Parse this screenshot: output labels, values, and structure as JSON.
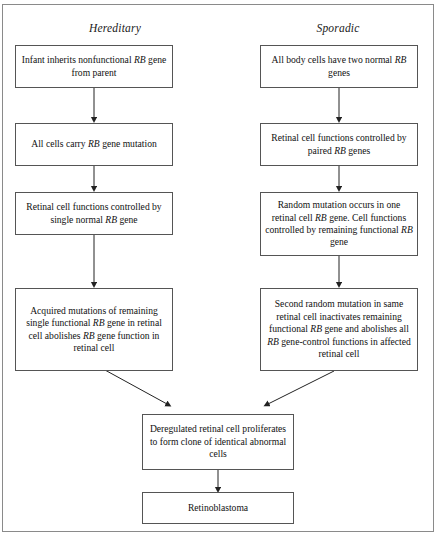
{
  "figure": {
    "type": "flowchart",
    "orientation": "top-to-bottom, two parallel columns converging",
    "frame": {
      "border_color": "#8a8a8a"
    }
  },
  "columns": [
    {
      "id": "hereditary",
      "heading": "Hereditary"
    },
    {
      "id": "sporadic",
      "heading": "Sporadic"
    }
  ],
  "nodes": {
    "h1": {
      "text": "Infant inherits nonfunctional RB gene from parent",
      "italic_tokens": [
        "RB"
      ]
    },
    "h2": {
      "text": "All cells carry RB gene mutation",
      "italic_tokens": [
        "RB"
      ]
    },
    "h3": {
      "text": "Retinal cell functions controlled by single normal RB gene",
      "italic_tokens": [
        "RB"
      ]
    },
    "h4": {
      "text": "Acquired mutations of remaining single functional RB gene in retinal cell abolishes RB gene function in retinal cell",
      "italic_tokens": [
        "RB"
      ]
    },
    "s1": {
      "text": "All body cells have two normal RB genes",
      "italic_tokens": [
        "RB"
      ]
    },
    "s2": {
      "text": "Retinal cell functions controlled by paired RB  genes",
      "italic_tokens": [
        "RB"
      ]
    },
    "s3": {
      "text": "Random mutation occurs in one retinal cell RB gene. Cell functions controlled by remaining functional RB gene",
      "italic_tokens": [
        "RB"
      ]
    },
    "s4": {
      "text": "Second random mutation in same retinal cell inactivates remaining functional RB gene and abolishes all RB gene-control functions in affected retinal cell",
      "italic_tokens": [
        "RB"
      ]
    },
    "c1": {
      "text": "Deregulated retinal cell proliferates to form clone of identical abnormal cells",
      "italic_tokens": []
    },
    "c2": {
      "text": "Retinoblastoma",
      "italic_tokens": []
    }
  },
  "edges": [
    {
      "from": "h1",
      "to": "h2",
      "style": "straight-vertical-arrow"
    },
    {
      "from": "h2",
      "to": "h3",
      "style": "straight-vertical-arrow"
    },
    {
      "from": "h3",
      "to": "h4",
      "style": "straight-vertical-arrow"
    },
    {
      "from": "h4",
      "to": "c1",
      "style": "diagonal-arrow"
    },
    {
      "from": "s1",
      "to": "s2",
      "style": "straight-vertical-arrow"
    },
    {
      "from": "s2",
      "to": "s3",
      "style": "straight-vertical-arrow"
    },
    {
      "from": "s3",
      "to": "s4",
      "style": "straight-vertical-arrow"
    },
    {
      "from": "s4",
      "to": "c1",
      "style": "diagonal-arrow"
    },
    {
      "from": "c1",
      "to": "c2",
      "style": "straight-vertical-arrow"
    }
  ],
  "colors": {
    "box_border": "#555555",
    "frame_border": "#8a8a8a",
    "text": "#111111",
    "arrow": "#222222",
    "background": "#ffffff"
  }
}
